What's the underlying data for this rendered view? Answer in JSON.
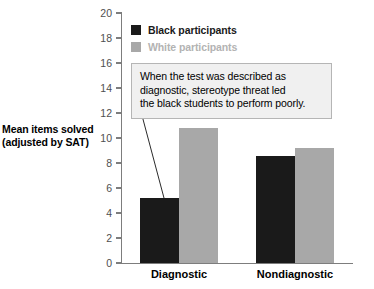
{
  "chart_data": {
    "type": "bar",
    "title": "",
    "xlabel": "",
    "ylabel": "Mean items solved (adjusted by SAT)",
    "ylim": [
      0,
      20
    ],
    "ytick_step": 2,
    "yticks": [
      20,
      18,
      16,
      14,
      12,
      10,
      8,
      6,
      4,
      2,
      0
    ],
    "grid": false,
    "legend_position": "top-left-inside",
    "categories": [
      "Diagnostic",
      "Nondiagnostic"
    ],
    "series": [
      {
        "name": "Black participants",
        "values": [
          5.2,
          8.6
        ],
        "color": "#1a1a1a"
      },
      {
        "name": "White participants",
        "values": [
          10.8,
          9.2
        ],
        "color": "#a8a8a8"
      }
    ],
    "annotations": [
      {
        "text": "When the test was described as diagnostic, stereotype threat led the black students to perform poorly.",
        "lines": [
          "When the test was described as",
          "diagnostic, stereotype threat led",
          "the black students to perform poorly."
        ],
        "points_to": "Diagnostic / Black participants bar"
      }
    ]
  },
  "axis": {
    "y_title_line1": "Mean items solved",
    "y_title_line2": "(adjusted by SAT)"
  },
  "colors": {
    "black_series": "#1a1a1a",
    "white_series": "#a8a8a8",
    "axis": "#7d7d7d",
    "tick_label": "#4f4f4f",
    "annotation_fill": "#f0f0f0",
    "annotation_border": "#b5b5b5",
    "legend_light_text": "#b3b3b3"
  }
}
